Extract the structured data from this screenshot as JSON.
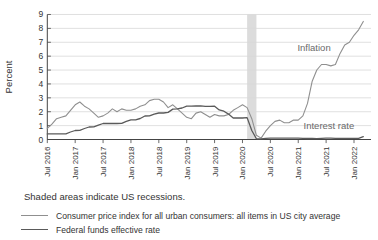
{
  "note": "Shaded areas indicate US recessions.",
  "chart_data": {
    "type": "line",
    "title": "",
    "xlabel": "",
    "ylabel": "Percent",
    "ylim": [
      0,
      9
    ],
    "grid": true,
    "legend_position": "bottom-left",
    "y_ticks": [
      0,
      1,
      2,
      3,
      4,
      5,
      6,
      7,
      8,
      9
    ],
    "x_tick_labels": [
      "Jul 2016",
      "Jan 2017",
      "Jul 2017",
      "Jan 2018",
      "Jul 2018",
      "Jan 2019",
      "Jul 2019",
      "Jan 2020",
      "Jul 2020",
      "Jan 2021",
      "Jul 2021",
      "Jan 2022"
    ],
    "x_tick_indices": [
      0,
      6,
      12,
      18,
      24,
      30,
      36,
      42,
      48,
      54,
      60,
      66
    ],
    "x_start": "Jul 2016",
    "x_end": "Mar 2022",
    "x_frequency": "monthly",
    "recession_band": {
      "start": "Feb 2020",
      "end": "Apr 2020",
      "start_index": 43,
      "end_index": 45,
      "color": "#dcdcdc"
    },
    "series": [
      {
        "name": "Consumer price index for all urban consumers: all items in US city average",
        "color": "#8f8f8f",
        "values": [
          0.8,
          1.1,
          1.5,
          1.6,
          1.7,
          2.1,
          2.5,
          2.7,
          2.4,
          2.2,
          1.9,
          1.6,
          1.7,
          1.9,
          2.2,
          2.0,
          2.2,
          2.1,
          2.1,
          2.2,
          2.4,
          2.5,
          2.8,
          2.9,
          2.9,
          2.7,
          2.3,
          2.5,
          2.2,
          1.9,
          1.6,
          1.5,
          1.9,
          2.0,
          1.8,
          1.6,
          1.8,
          1.7,
          1.7,
          1.8,
          2.1,
          2.3,
          2.5,
          2.3,
          1.5,
          0.3,
          0.1,
          0.6,
          1.0,
          1.3,
          1.4,
          1.2,
          1.2,
          1.4,
          1.4,
          1.7,
          2.6,
          4.2,
          5.0,
          5.4,
          5.4,
          5.3,
          5.4,
          6.2,
          6.8,
          7.0,
          7.5,
          7.9,
          8.5
        ]
      },
      {
        "name": "Federal funds effective rate",
        "color": "#5a5a5a",
        "values": [
          0.4,
          0.4,
          0.4,
          0.4,
          0.41,
          0.54,
          0.65,
          0.66,
          0.79,
          0.9,
          0.91,
          1.04,
          1.15,
          1.16,
          1.15,
          1.15,
          1.16,
          1.3,
          1.41,
          1.42,
          1.51,
          1.69,
          1.7,
          1.82,
          1.91,
          1.91,
          1.95,
          2.19,
          2.2,
          2.27,
          2.4,
          2.4,
          2.41,
          2.42,
          2.39,
          2.38,
          2.4,
          2.13,
          2.04,
          1.83,
          1.55,
          1.55,
          1.55,
          1.58,
          0.65,
          0.05,
          0.05,
          0.08,
          0.09,
          0.1,
          0.09,
          0.09,
          0.09,
          0.09,
          0.09,
          0.08,
          0.07,
          0.07,
          0.06,
          0.08,
          0.1,
          0.09,
          0.08,
          0.08,
          0.08,
          0.08,
          0.08,
          0.08,
          0.2
        ]
      }
    ],
    "annotations": [
      {
        "text": "Inflation",
        "x_index": 57.4,
        "y_value": 6.6
      },
      {
        "text": "Interest rate",
        "x_index": 60.6,
        "y_value": 1.0
      }
    ],
    "style": {
      "gridline_color": "#d8d8d8",
      "axis_color": "#444444",
      "tick_text_color": "#333333",
      "background": "#ffffff"
    }
  }
}
